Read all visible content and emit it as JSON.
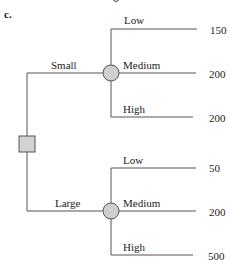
{
  "figure": {
    "part_label": "c.",
    "colors": {
      "line": "#555555",
      "node_fill": "#cfcfcf",
      "node_stroke": "#555555",
      "text": "#222222"
    },
    "root": {
      "type": "decision",
      "shape": "square-icon"
    },
    "branches": [
      {
        "label": "Small",
        "chance_node": "circle-icon",
        "outcomes": [
          {
            "label": "Low",
            "value": "150"
          },
          {
            "label": "Medium",
            "value": "200"
          },
          {
            "label": "High",
            "value": "200"
          }
        ]
      },
      {
        "label": "Large",
        "chance_node": "circle-icon",
        "outcomes": [
          {
            "label": "Low",
            "value": "50"
          },
          {
            "label": "Medium",
            "value": "200"
          },
          {
            "label": "High",
            "value": "500"
          }
        ]
      }
    ],
    "top_partial_shape": "diamond-icon"
  }
}
